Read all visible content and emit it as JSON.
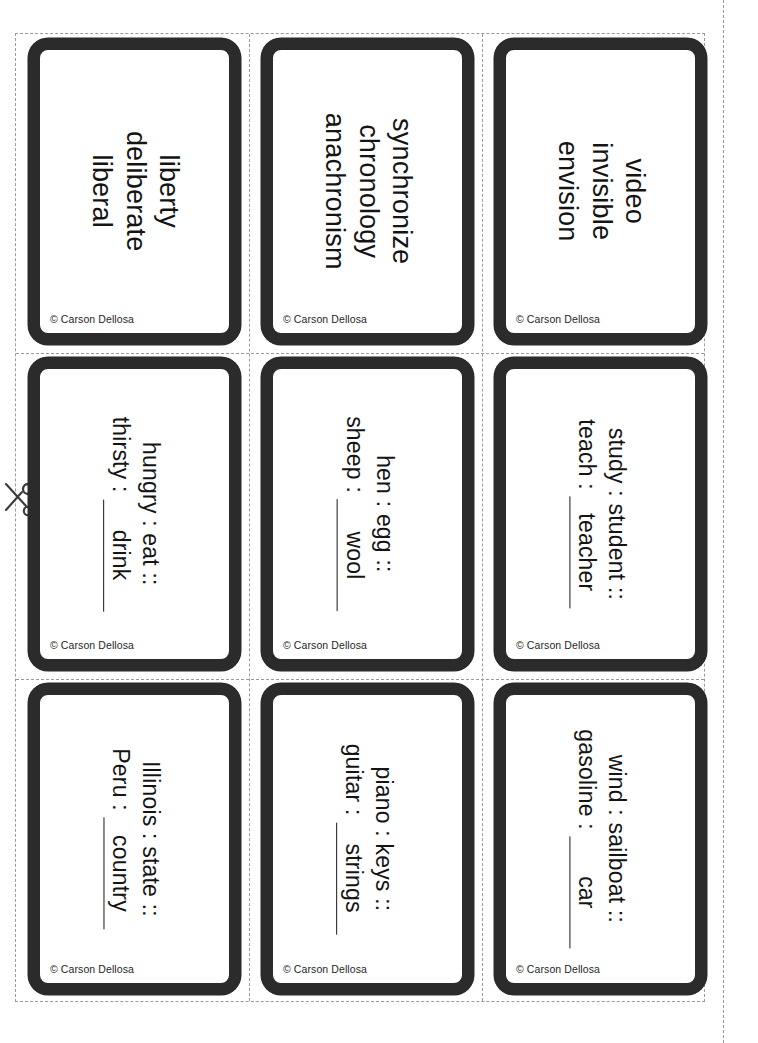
{
  "sheet": {
    "title": "Vocabulary and Analogy Flash Card Sheet",
    "publisher": "Carson Dellosa",
    "copyright_mark": "©",
    "copyright_text": "Carson Dellosa",
    "colors": {
      "card_border": "#2b2b2b",
      "cut_line": "#9a9a9a",
      "text": "#141414",
      "page_background": "#ffffff"
    },
    "icons": {
      "scissors": "scissors-icon",
      "cut_guide": "dashed-cut-line"
    }
  },
  "grid": {
    "columns": 3,
    "rows": 3
  },
  "cards": [
    {
      "id": "card-1",
      "type": "vocab",
      "row": 1,
      "column": 1,
      "lines": [
        "liberty",
        "deliberate",
        "liberal"
      ],
      "credit": "© Carson Dellosa"
    },
    {
      "id": "card-2",
      "type": "vocab",
      "row": 1,
      "column": 2,
      "lines": [
        "synchronize",
        "chronology",
        "anachronism"
      ],
      "credit": "© Carson Dellosa"
    },
    {
      "id": "card-3",
      "type": "vocab",
      "row": 1,
      "column": 3,
      "lines": [
        "video",
        "invisible",
        "envision"
      ],
      "credit": "© Carson Dellosa"
    },
    {
      "id": "card-4",
      "type": "analogy",
      "row": 2,
      "column": 1,
      "line1": "hungry : eat ::",
      "line2_prefix": "thirsty :",
      "answer": "drink",
      "credit": "© Carson Dellosa"
    },
    {
      "id": "card-5",
      "type": "analogy",
      "row": 2,
      "column": 2,
      "line1": "hen : egg ::",
      "line2_prefix": "sheep :",
      "answer": "wool",
      "credit": "© Carson Dellosa"
    },
    {
      "id": "card-6",
      "type": "analogy",
      "row": 2,
      "column": 3,
      "line1": "study : student ::",
      "line2_prefix": "teach :",
      "answer": "teacher",
      "credit": "© Carson Dellosa"
    },
    {
      "id": "card-7",
      "type": "analogy",
      "row": 3,
      "column": 1,
      "line1": "Illinois : state ::",
      "line2_prefix": "Peru :",
      "answer": "country",
      "credit": "© Carson Dellosa"
    },
    {
      "id": "card-8",
      "type": "analogy",
      "row": 3,
      "column": 2,
      "line1": "piano : keys ::",
      "line2_prefix": "guitar :",
      "answer": "strings",
      "credit": "© Carson Dellosa"
    },
    {
      "id": "card-9",
      "type": "analogy",
      "row": 3,
      "column": 3,
      "line1": "wind : sailboat ::",
      "line2_prefix": "gasoline :",
      "answer": "car",
      "credit": "© Carson Dellosa"
    }
  ]
}
